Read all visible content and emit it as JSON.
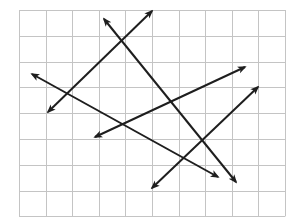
{
  "diagram": {
    "type": "grid-with-lines",
    "background": "#ffffff",
    "grid": {
      "left": 19,
      "top": 10,
      "columns": 10,
      "rows": 8,
      "cell_width": 26.6,
      "cell_height": 25.8,
      "line_color": "#c4c4c4",
      "line_width": 1
    },
    "line_color": "#1e1e1e",
    "line_width": 2,
    "lines": [
      {
        "id": "line-1",
        "x1": 48,
        "y1": 112,
        "x2": 152,
        "y2": 11,
        "arrows": "both"
      },
      {
        "id": "line-2",
        "x1": 104,
        "y1": 19,
        "x2": 236,
        "y2": 182,
        "arrows": "both"
      },
      {
        "id": "line-3",
        "x1": 32,
        "y1": 74,
        "x2": 218,
        "y2": 177,
        "arrows": "both"
      },
      {
        "id": "line-4",
        "x1": 95,
        "y1": 137,
        "x2": 245,
        "y2": 67,
        "arrows": "both"
      },
      {
        "id": "line-5",
        "x1": 152,
        "y1": 188,
        "x2": 258,
        "y2": 87,
        "arrows": "both"
      }
    ]
  }
}
